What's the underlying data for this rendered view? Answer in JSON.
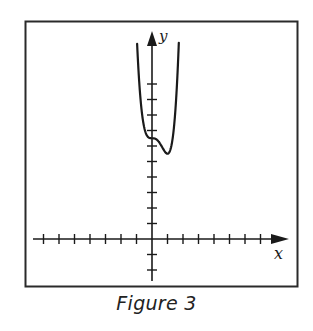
{
  "figure": {
    "caption": "Figure 3"
  },
  "chart_data": {
    "type": "line",
    "title": "",
    "caption": "Figure 3",
    "xlabel": "x",
    "ylabel": "y",
    "xlim": [
      -7,
      7
    ],
    "ylim": [
      -2,
      10
    ],
    "x_ticks": [
      -7,
      -6,
      -5,
      -4,
      -3,
      -2,
      -1,
      1,
      2,
      3,
      4,
      5,
      6,
      7
    ],
    "y_ticks": [
      -2,
      -1,
      1,
      2,
      3,
      4,
      5,
      6,
      7,
      8,
      9,
      10
    ],
    "tick_labels_shown": false,
    "grid": false,
    "legend": null,
    "series": [
      {
        "name": "f(x)",
        "description": "Quartic curve with horizontal inflection at (0, 6.5) and local minimum near (1, 5.5); both branches rise steeply past the top of the window",
        "x": [
          -1.05,
          -1.0,
          -0.8,
          -0.6,
          -0.4,
          -0.2,
          0.0,
          0.2,
          0.4,
          0.6,
          0.8,
          1.0,
          1.2,
          1.4,
          1.6,
          1.7
        ],
        "y": [
          12.9,
          13.5,
          10.77,
          7.75,
          6.83,
          6.54,
          6.5,
          6.47,
          6.33,
          6.03,
          5.68,
          5.5,
          5.81,
          7.06,
          9.78,
          11.9
        ]
      }
    ],
    "colors": {
      "axis": "#1a1a1a",
      "curve": "#1a1a1a",
      "frame": "#2a2a2a"
    }
  }
}
